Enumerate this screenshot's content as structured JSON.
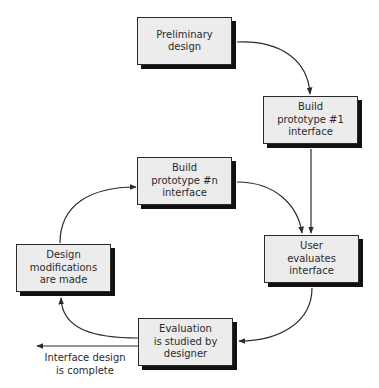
{
  "diagram": {
    "type": "flowchart",
    "title": "",
    "colors": {
      "box_fill": "#ececec",
      "box_border": "#2a2a2a",
      "shadow": "#111111",
      "line": "#2b2b2b",
      "text": "#2b2b2b"
    },
    "nodes": [
      {
        "id": "preliminary",
        "label": "Preliminary\ndesign"
      },
      {
        "id": "proto1",
        "label": "Build\nprototype #1\ninterface"
      },
      {
        "id": "protoN",
        "label": "Build\nprototype #n\ninterface"
      },
      {
        "id": "user_eval",
        "label": "User\nevaluates\ninterface"
      },
      {
        "id": "modifications",
        "label": "Design\nmodifications\nare made"
      },
      {
        "id": "evaluation",
        "label": "Evaluation\nis studied by\ndesigner"
      }
    ],
    "edges": [
      {
        "from": "preliminary",
        "to": "proto1"
      },
      {
        "from": "proto1",
        "to": "user_eval"
      },
      {
        "from": "protoN",
        "to": "user_eval"
      },
      {
        "from": "user_eval",
        "to": "evaluation"
      },
      {
        "from": "evaluation",
        "to": "modifications"
      },
      {
        "from": "modifications",
        "to": "protoN"
      },
      {
        "from": "evaluation",
        "to": "exit",
        "label": "Interface design\nis complete"
      }
    ],
    "exit_label": "Interface design\nis complete"
  }
}
